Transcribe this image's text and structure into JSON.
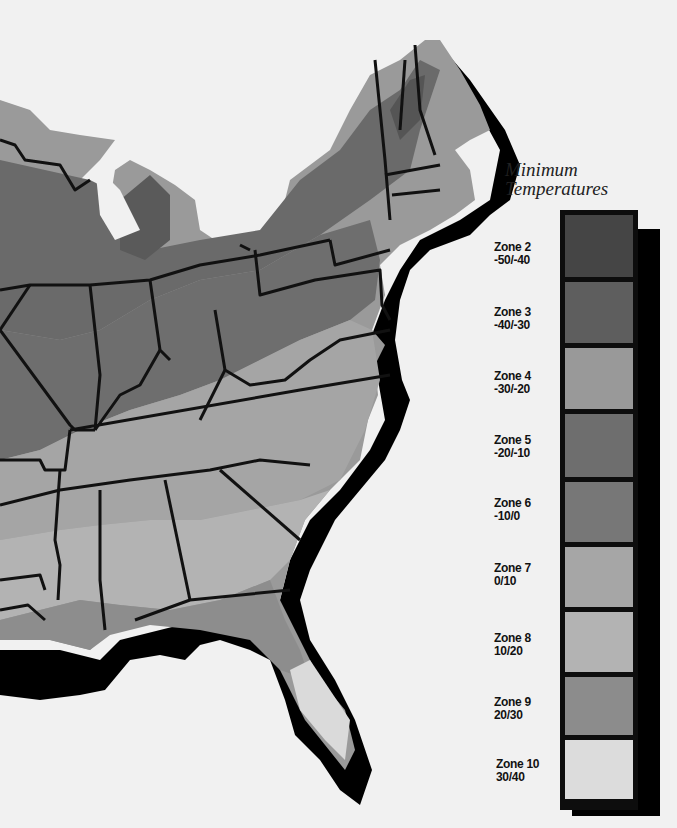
{
  "title_line1": "Minimum",
  "title_line2": "Temperatures",
  "legend": [
    {
      "zone": "Zone 2",
      "range": "-50/-40",
      "color": "#454545"
    },
    {
      "zone": "Zone 3",
      "range": "-40/-30",
      "color": "#5e5e5e"
    },
    {
      "zone": "Zone 4",
      "range": "-30/-20",
      "color": "#999999"
    },
    {
      "zone": "Zone 5",
      "range": "-20/-10",
      "color": "#6e6e6e"
    },
    {
      "zone": "Zone 6",
      "range": "-10/0",
      "color": "#777777"
    },
    {
      "zone": "Zone 7",
      "range": "0/10",
      "color": "#a6a6a6"
    },
    {
      "zone": "Zone 8",
      "range": "10/20",
      "color": "#b3b3b3"
    },
    {
      "zone": "Zone 9",
      "range": "20/30",
      "color": "#8c8c8c"
    },
    {
      "zone": "Zone 10",
      "range": "30/40",
      "color": "#dcdcdc"
    }
  ],
  "map_colors": {
    "background": "#f1f1f1",
    "shadow": "#000000",
    "border": "#111111"
  }
}
